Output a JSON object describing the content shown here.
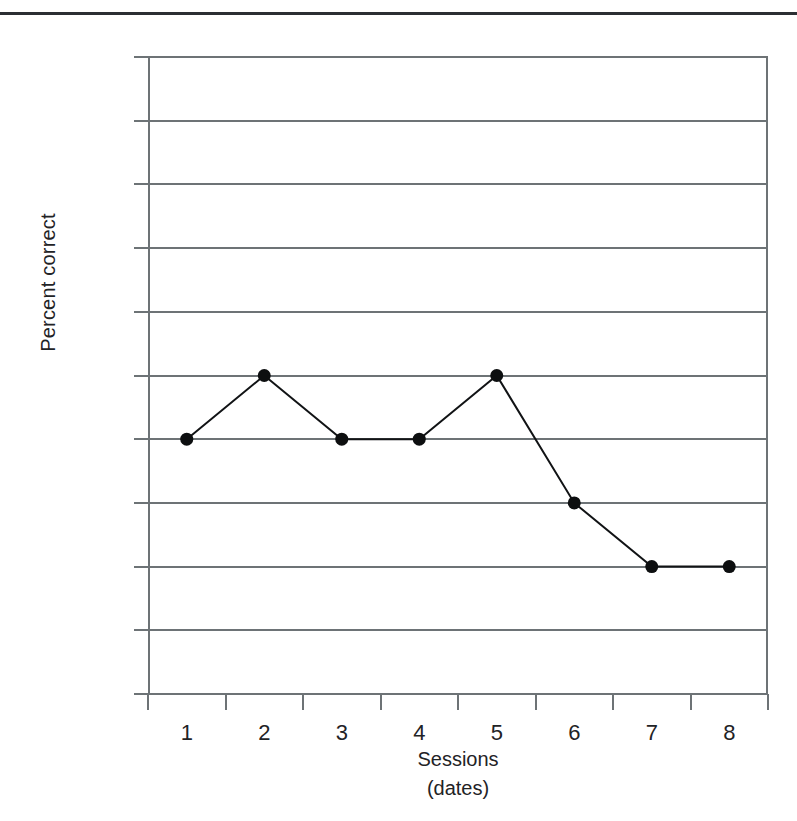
{
  "figure": {
    "top_rule": "horizontal-rule"
  },
  "chart_data": {
    "type": "line",
    "title": "",
    "xlabel": "Sessions",
    "xlabel_sub": "(dates)",
    "ylabel": "Percent correct",
    "categories": [
      "1",
      "2",
      "3",
      "4",
      "5",
      "6",
      "7",
      "8"
    ],
    "values": [
      40,
      50,
      40,
      40,
      50,
      30,
      20,
      20
    ],
    "series": [
      {
        "name": "Percent correct",
        "values": [
          40,
          50,
          40,
          40,
          50,
          30,
          20,
          20
        ]
      }
    ],
    "ylim": [
      0,
      100
    ],
    "ytick_labels": [
      "100",
      "90",
      "80",
      "70",
      "60",
      "50",
      "40",
      "30",
      "20",
      "10",
      "0"
    ],
    "ytick_values": [
      100,
      90,
      80,
      70,
      60,
      50,
      40,
      30,
      20,
      10,
      0
    ],
    "grid": true,
    "grid_axis": "y",
    "legend": "none",
    "marker": "filled-circle",
    "line_color": "#111315",
    "grid_color": "#6d7376",
    "text_color": "#1f2326"
  }
}
